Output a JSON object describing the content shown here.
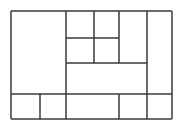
{
  "figure": {
    "name": "rectangle-partition-diagram",
    "type": "line-diagram",
    "canvas": {
      "width": 185,
      "height": 128
    },
    "background_color": "#ffffff",
    "stroke_color": "#3a3a3a",
    "stroke_width": 1.5,
    "outer_border": {
      "x1": 11,
      "y1": 11,
      "x2": 172,
      "y2": 119
    },
    "segments": [
      {
        "name": "outer-border-top",
        "orientation": "horizontal",
        "x1": 11,
        "y1": 11,
        "x2": 172,
        "y2": 11
      },
      {
        "name": "outer-border-bottom",
        "orientation": "horizontal",
        "x1": 11,
        "y1": 119,
        "x2": 172,
        "y2": 119
      },
      {
        "name": "outer-border-left",
        "orientation": "vertical",
        "x1": 11,
        "y1": 11,
        "x2": 11,
        "y2": 119
      },
      {
        "name": "outer-border-right",
        "orientation": "vertical",
        "x1": 172,
        "y1": 11,
        "x2": 172,
        "y2": 119
      },
      {
        "name": "divider-vertical-left",
        "orientation": "vertical",
        "x1": 66,
        "y1": 11,
        "x2": 66,
        "y2": 119
      },
      {
        "name": "divider-vertical-mid",
        "orientation": "vertical",
        "x1": 94,
        "y1": 11,
        "x2": 94,
        "y2": 63
      },
      {
        "name": "divider-vertical-inner",
        "orientation": "vertical",
        "x1": 119,
        "y1": 11,
        "x2": 119,
        "y2": 63
      },
      {
        "name": "divider-vertical-right",
        "orientation": "vertical",
        "x1": 147,
        "y1": 11,
        "x2": 147,
        "y2": 119
      },
      {
        "name": "divider-horizontal-upper",
        "orientation": "horizontal",
        "x1": 66,
        "y1": 38,
        "x2": 119,
        "y2": 38
      },
      {
        "name": "divider-horizontal-mid",
        "orientation": "horizontal",
        "x1": 66,
        "y1": 63,
        "x2": 147,
        "y2": 63
      },
      {
        "name": "divider-horizontal-low",
        "orientation": "horizontal",
        "x1": 11,
        "y1": 94,
        "x2": 172,
        "y2": 94
      },
      {
        "name": "bottom-row-divider-1",
        "orientation": "vertical",
        "x1": 40,
        "y1": 94,
        "x2": 40,
        "y2": 119
      },
      {
        "name": "bottom-row-divider-2",
        "orientation": "vertical",
        "x1": 119,
        "y1": 94,
        "x2": 119,
        "y2": 119
      }
    ],
    "cells": [
      {
        "name": "cell-large-left",
        "x": 11,
        "y": 11,
        "width": 55,
        "height": 83
      },
      {
        "name": "cell-top-a",
        "x": 66,
        "y": 11,
        "width": 28,
        "height": 27
      },
      {
        "name": "cell-top-b",
        "x": 94,
        "y": 11,
        "width": 25,
        "height": 27
      },
      {
        "name": "cell-mid-a",
        "x": 66,
        "y": 38,
        "width": 28,
        "height": 25
      },
      {
        "name": "cell-mid-b",
        "x": 94,
        "y": 38,
        "width": 25,
        "height": 25
      },
      {
        "name": "cell-top-tall",
        "x": 119,
        "y": 11,
        "width": 28,
        "height": 52
      },
      {
        "name": "cell-right-tall",
        "x": 147,
        "y": 11,
        "width": 25,
        "height": 83
      },
      {
        "name": "cell-wide-band",
        "x": 66,
        "y": 63,
        "width": 81,
        "height": 31
      },
      {
        "name": "cell-bottom-1",
        "x": 11,
        "y": 94,
        "width": 29,
        "height": 25
      },
      {
        "name": "cell-bottom-2",
        "x": 40,
        "y": 94,
        "width": 26,
        "height": 25
      },
      {
        "name": "cell-bottom-3",
        "x": 66,
        "y": 94,
        "width": 53,
        "height": 25
      },
      {
        "name": "cell-bottom-4",
        "x": 119,
        "y": 94,
        "width": 28,
        "height": 25
      },
      {
        "name": "cell-bottom-5",
        "x": 147,
        "y": 94,
        "width": 25,
        "height": 25
      }
    ]
  }
}
